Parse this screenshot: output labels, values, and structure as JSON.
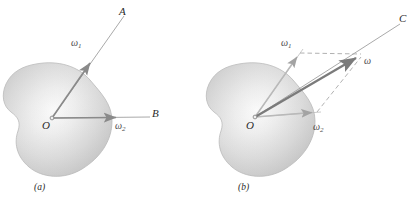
{
  "figure": {
    "title_hidden": "",
    "panels": [
      {
        "id": "a",
        "caption": "(a)",
        "origin_label": "O",
        "axis_labels": [
          "A",
          "B"
        ],
        "vectors": [
          {
            "name": "omega1",
            "label": "ω",
            "sub": "1",
            "from": "O",
            "toward": "A"
          },
          {
            "name": "omega2",
            "label": "ω",
            "sub": "2",
            "from": "O",
            "toward": "B"
          }
        ]
      },
      {
        "id": "b",
        "caption": "(b)",
        "origin_label": "O",
        "axis_labels": [
          "C"
        ],
        "vectors": [
          {
            "name": "omega1",
            "label": "ω",
            "sub": "1",
            "from": "O",
            "toward": "A"
          },
          {
            "name": "omega2",
            "label": "ω",
            "sub": "2",
            "from": "O",
            "toward": "B"
          },
          {
            "name": "omega-resultant",
            "label": "ω",
            "sub": "",
            "from": "O",
            "toward": "C"
          }
        ]
      }
    ],
    "colors": {
      "body_fill_light": "#f2f2f2",
      "body_fill_mid": "#d6d6d6",
      "body_fill_dark": "#b9b9b9",
      "vector_stroke": "#8c8c8c",
      "vector_stroke_dark": "#7a7a7a",
      "dash_stroke": "#a8a8a8",
      "thin_line": "#9a9a9a",
      "text": "#2b2b2b"
    }
  }
}
